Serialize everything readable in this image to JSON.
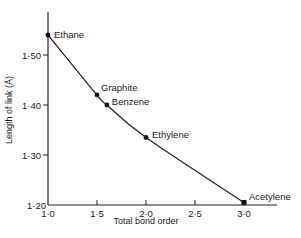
{
  "chart_data": {
    "type": "line",
    "title": "",
    "xlabel": "Total bond order",
    "ylabel": "Length of link (Å)",
    "xlim": [
      1.0,
      3.0
    ],
    "ylim": [
      1.2,
      1.58
    ],
    "x_ticks": [
      {
        "value": 1.0,
        "label": "1·0"
      },
      {
        "value": 1.5,
        "label": "1·5"
      },
      {
        "value": 2.0,
        "label": "2·0"
      },
      {
        "value": 2.5,
        "label": "2·5"
      },
      {
        "value": 3.0,
        "label": "3·0"
      }
    ],
    "y_ticks": [
      {
        "value": 1.2,
        "label": "1·20"
      },
      {
        "value": 1.3,
        "label": "1·30"
      },
      {
        "value": 1.4,
        "label": "1·40"
      },
      {
        "value": 1.5,
        "label": "1·50"
      }
    ],
    "grid": false,
    "legend": null,
    "points": [
      {
        "name": "Ethane",
        "x": 1.0,
        "y": 1.54
      },
      {
        "name": "Graphite",
        "x": 1.5,
        "y": 1.42
      },
      {
        "name": "Benzene",
        "x": 1.6,
        "y": 1.4
      },
      {
        "name": "Ethylene",
        "x": 2.0,
        "y": 1.335
      },
      {
        "name": "Acetylene",
        "x": 3.0,
        "y": 1.205
      }
    ],
    "curve": "smooth decreasing curve through all points"
  }
}
